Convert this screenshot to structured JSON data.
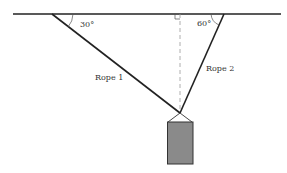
{
  "diagram": {
    "angle_left": "30°",
    "angle_right": "60°",
    "rope1_label": "Rope 1",
    "rope2_label": "Rope 2",
    "colors": {
      "line": "#222222",
      "box_fill": "#8a8a8a",
      "dashed": "#999999"
    }
  }
}
